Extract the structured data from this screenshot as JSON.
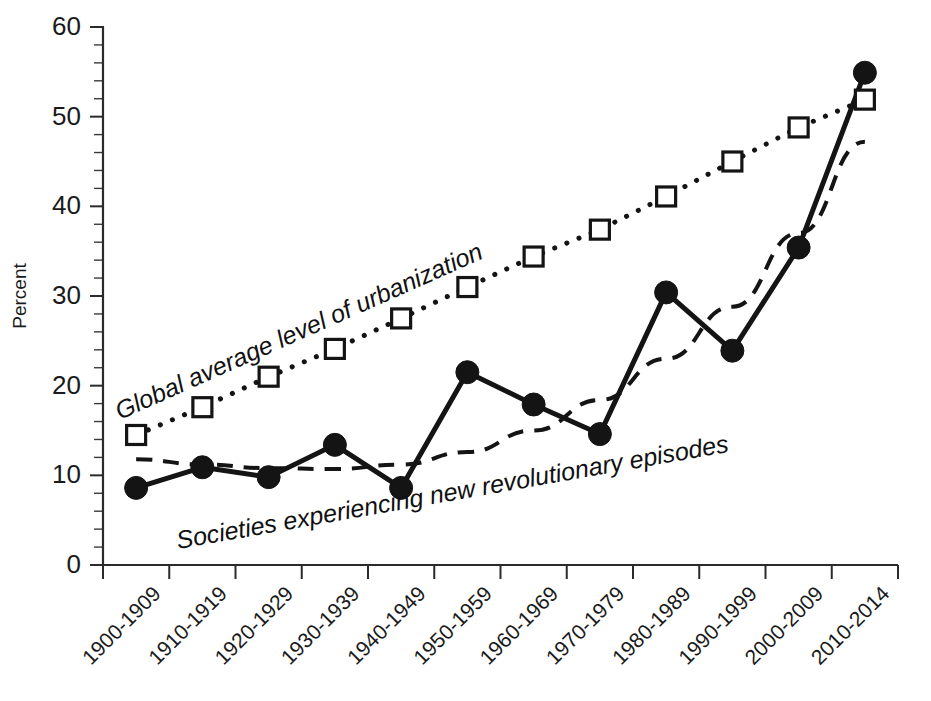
{
  "chart_data": {
    "type": "line",
    "title": "",
    "subtitle": "",
    "xlabel": "",
    "ylabel": "Percent",
    "ylim": [
      0,
      60
    ],
    "ytick_values": [
      0,
      10,
      20,
      30,
      40,
      50,
      60
    ],
    "ytick_labels": [
      "0",
      "10",
      "20",
      "30",
      "40",
      "50",
      "60"
    ],
    "y_minor_step": 2,
    "grid": false,
    "legend_position": "none",
    "categories": [
      "1900-1909",
      "1910-1919",
      "1920-1929",
      "1930-1939",
      "1940-1949",
      "1950-1959",
      "1960-1969",
      "1970-1979",
      "1980-1989",
      "1990-1999",
      "2000-2009",
      "2010-2014"
    ],
    "series": [
      {
        "name": "Global average level of urbanization",
        "marker": "open-square",
        "line_style": "dotted",
        "color": "#141414",
        "values": [
          14.5,
          17.6,
          21.0,
          24.1,
          27.5,
          31.0,
          34.4,
          37.4,
          41.1,
          45.0,
          48.8,
          51.9
        ]
      },
      {
        "name": "Societies experiencing new revolutionary episodes",
        "marker": "filled-circle",
        "line_style": "solid",
        "color": "#141414",
        "values": [
          8.6,
          10.9,
          9.8,
          13.4,
          8.6,
          21.5,
          17.9,
          14.6,
          30.4,
          23.9,
          35.4,
          54.9
        ]
      },
      {
        "name": "Trend of societies experiencing new revolutionary episodes",
        "marker": "none",
        "line_style": "dashed",
        "color": "#141414",
        "values": [
          11.8,
          11.2,
          10.8,
          10.7,
          11.2,
          12.6,
          15.0,
          18.4,
          23.0,
          28.8,
          37.0,
          47.2
        ]
      }
    ],
    "annotations": [
      {
        "name": "urbanization-label",
        "text": "Global average level of urbanization",
        "rotation": -24,
        "x": 120,
        "y": 420
      },
      {
        "name": "revolutions-label",
        "text": "Societies experiencing new revolutionary episodes",
        "rotation": -10,
        "x": 178,
        "y": 549
      }
    ]
  },
  "axes": {
    "ylabel": "Percent",
    "plot_left": 103,
    "plot_right": 898,
    "plot_top": 27,
    "plot_bottom": 565
  },
  "colors": {
    "ink": "#141414",
    "axis": "#2b2b2b",
    "background": "#ffffff"
  }
}
